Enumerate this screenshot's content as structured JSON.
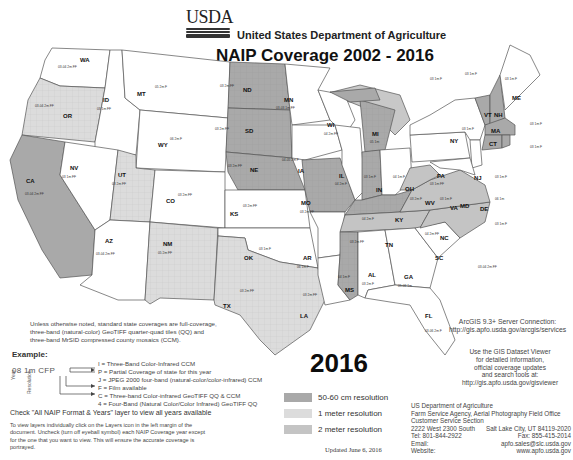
{
  "header": {
    "logo_text": "USDA",
    "department": "United States Department of Agriculture",
    "title": "NAIP Coverage 2002 - 2016"
  },
  "colors": {
    "res_50_60cm": "#a9a9a9",
    "res_1m": "#dcdcdc",
    "res_2m": "#c4c4c4",
    "no_coverage": "#ffffff",
    "water": "#c8c8c8",
    "border": "#555555"
  },
  "map": {
    "states": [
      {
        "abbr": "WA",
        "fill": "white",
        "notes": [
          "03-04 2m FF",
          "05 2m F",
          "06 1m F",
          "09-11-13-15 1m 4"
        ]
      },
      {
        "abbr": "OR",
        "fill": "1m",
        "notes": [
          "03-04 2m FF",
          "05 1m F",
          "09 2m FF",
          "09 1m F",
          "11-12-14-16 1m 4"
        ]
      },
      {
        "abbr": "ID",
        "fill": "white",
        "notes": [
          "03 1m FF",
          "04 1m",
          "06 2m FF",
          "09-11 1m 4",
          "13 50cm 4",
          "15 1m 4"
        ]
      },
      {
        "abbr": "MT",
        "fill": "white",
        "notes": [
          "05 2m F",
          "05 1m",
          "09 2m F",
          "09-11-13-15 1m 4"
        ]
      },
      {
        "abbr": "WY",
        "fill": "white",
        "notes": [
          "06 2m F",
          "06 1m",
          "09-12 1m 4",
          "15 50cm 4"
        ]
      },
      {
        "abbr": "CA",
        "fill": "50-60cm",
        "notes": [
          "03-04 2m FF",
          "05 1m",
          "06 2m F",
          "09-10 1m 4",
          "12-14 1m 4",
          "16 60cm 4"
        ]
      },
      {
        "abbr": "NV",
        "fill": "white",
        "notes": [
          "03 1m FF",
          "06 1m F",
          "10-13-15 1m 4"
        ]
      },
      {
        "abbr": "UT",
        "fill": "1m",
        "notes": [
          "03 2m FF",
          "04 1m FF",
          "06-09 1m",
          "11-14-16 1m 4"
        ]
      },
      {
        "abbr": "CO",
        "fill": "white",
        "notes": [
          "03 2m FF",
          "05 1m F",
          "05 2m FF",
          "09-11-13-15 1m 4"
        ]
      },
      {
        "abbr": "AZ",
        "fill": "white",
        "notes": [
          "03-04 2m FF",
          "07-10-13-15 1m 4"
        ]
      },
      {
        "abbr": "NM",
        "fill": "1m",
        "notes": [
          "05 2m FF",
          "09 1m",
          "11-14-16 1m 4"
        ]
      },
      {
        "abbr": "ND",
        "fill": "50-60cm",
        "notes": [
          "03 2m FF",
          "04 1m F",
          "05 1m F",
          "06 1m",
          "09-10 1m 4",
          "12-14-16 1m 4",
          "16 60cm 4"
        ]
      },
      {
        "abbr": "SD",
        "fill": "50-60cm",
        "notes": [
          "03 2m FF",
          "04 1m F",
          "05 1m F",
          "06 1m",
          "10-12-14 1m 4",
          "16 60cm 4"
        ]
      },
      {
        "abbr": "NE",
        "fill": "50-60cm",
        "notes": [
          "03 2m FF",
          "04 1m",
          "05-06 2m F",
          "06 1m",
          "07 2m FF",
          "09-10 1m 4",
          "12-14 1m 4",
          "16 60cm 4"
        ]
      },
      {
        "abbr": "KS",
        "fill": "white",
        "notes": [
          "03 2m FF",
          "03-05 2m F",
          "06 1m",
          "08 1m C",
          "10-12-14-15 1m 4"
        ]
      },
      {
        "abbr": "OK",
        "fill": "white",
        "notes": [
          "03 1m F",
          "04-06 1m F",
          "08 1m",
          "10-13-15 1m 4"
        ]
      },
      {
        "abbr": "TX",
        "fill": "1m",
        "notes": [
          "03 2m FF",
          "04 1m C",
          "05 1m",
          "06 2m FF",
          "08 1m 4P",
          "09 2m F",
          "10 1m 4",
          "12-14-16 1m 4"
        ]
      },
      {
        "abbr": "MN",
        "fill": "white",
        "notes": [
          "03-03 1m FF",
          "03 1m 2m FF",
          "05-06 2m FF",
          "08 1m 4J",
          "09 1m 4",
          "10-13-15 1m 4"
        ]
      },
      {
        "abbr": "IA",
        "fill": "white",
        "notes": [
          "04-05 2m F",
          "06 1m F",
          "07 2m F",
          "08-09 1m 4",
          "10-13 1m 4",
          "11-15 1m 4"
        ]
      },
      {
        "abbr": "MO",
        "fill": "50-60cm",
        "notes": [
          "03 2m FF",
          "03 1m F",
          "05-06 2m F",
          "07 1m F",
          "08-10-12-14 1m 4",
          "16 60cm 4"
        ]
      },
      {
        "abbr": "AR",
        "fill": "white",
        "notes": [
          "06 1m F",
          "09 1m",
          "10-13-15 1m 4"
        ]
      },
      {
        "abbr": "LA",
        "fill": "white",
        "notes": [
          "03 2m FF",
          "04 1m F",
          "05-06 1m F",
          "07 1m",
          "10-13-15 1m 4"
        ]
      },
      {
        "abbr": "WI",
        "fill": "white",
        "notes": [
          "04 2m FF",
          "05 1m F",
          "06 2m F",
          "08 1m",
          "10-13-15 1m 4"
        ]
      },
      {
        "abbr": "IL",
        "fill": "white",
        "notes": [
          "04 2m F",
          "05-06 2m F",
          "07-09 1m 4",
          "10-12 1m 4",
          "14 1m 4"
        ]
      },
      {
        "abbr": "MI",
        "fill": "50-60cm",
        "notes": [
          "05 1m",
          "09 1m F",
          "10 1m",
          "12-14 1m 4",
          "16 60cm 4"
        ]
      },
      {
        "abbr": "IN",
        "fill": "50-60cm",
        "notes": [
          "03 1m F",
          "05 2m FF",
          "06 1m",
          "08-10 1m",
          "12 1m 4",
          "14-16 1m 4"
        ]
      },
      {
        "abbr": "OH",
        "fill": "white",
        "notes": [
          "04 1m F",
          "05 2m F",
          "06 1m",
          "09-11 1m 4",
          "13-15 1m 4"
        ]
      },
      {
        "abbr": "KY",
        "fill": "50-60cm",
        "notes": [
          "04 2m F",
          "06 1m",
          "08-10 1m 4",
          "12-14 1m 4",
          "16 60cm 4"
        ]
      },
      {
        "abbr": "TN",
        "fill": "2m",
        "notes": [
          "03 2m FF",
          "05 1m",
          "06 1m J",
          "08-10-12-14 1m 4"
        ]
      },
      {
        "abbr": "MS",
        "fill": "50-60cm",
        "notes": [
          "04 1m F",
          "05 1m",
          "06 2m F",
          "07-09 1m",
          "10-12-14 1m 4",
          "16 60cm 4"
        ]
      },
      {
        "abbr": "AL",
        "fill": "white",
        "notes": [
          "03 2m F",
          "05 1m",
          "06-11-13-15 1m 4"
        ]
      },
      {
        "abbr": "GA",
        "fill": "white",
        "notes": [
          "05-06 1m",
          "07 1m",
          "09-10-13-15 1m 4"
        ]
      },
      {
        "abbr": "FL",
        "fill": "white",
        "notes": [
          "03-06 2m F",
          "07 1m",
          "10-13-15 1m 4"
        ]
      },
      {
        "abbr": "SC",
        "fill": "white",
        "notes": [
          "03-04 2m FF",
          "05 1m",
          "06 1m F",
          "09-11-13-15 1m 4"
        ]
      },
      {
        "abbr": "NC",
        "fill": "2m",
        "notes": [
          "04 2m FF",
          "05 1m F",
          "06 1m",
          "08-10 1m 4",
          "12-14-16 1m 4"
        ]
      },
      {
        "abbr": "VA",
        "fill": "2m",
        "notes": [
          "03 1m F",
          "04 1m FF",
          "06 2m F",
          "08 1m",
          "09-11 1m 4",
          "12-14-16 1m 4"
        ]
      },
      {
        "abbr": "WV",
        "fill": "2m",
        "notes": [
          "03 2m F",
          "05 1m",
          "07 1m",
          "09-11-14-16 1m 4"
        ]
      },
      {
        "abbr": "PA",
        "fill": "white",
        "notes": [
          "03 1m FF",
          "04 1m F",
          "05 2m F",
          "06 1m F",
          "08-10-13-15 1m 4"
        ]
      },
      {
        "abbr": "NY",
        "fill": "white",
        "notes": [
          "03 1m F",
          "04 1m FF",
          "06 1m",
          "09-11 1m 4",
          "13-15 1m 4"
        ]
      },
      {
        "abbr": "NJ",
        "fill": "white",
        "notes": [
          "03 1m F",
          "06 1m",
          "08 1m F",
          "10-13-15 1m 4"
        ]
      },
      {
        "abbr": "DE",
        "fill": "white",
        "notes": [
          "06 1m",
          "08-10-11-13-15 1m 4"
        ]
      },
      {
        "abbr": "MD",
        "fill": "white",
        "notes": [
          "03 1m F",
          "05 1m F",
          "07 1m",
          "09-11-13-15 1m 4"
        ]
      },
      {
        "abbr": "VT",
        "fill": "50-60cm",
        "notes": [
          "03 1m F",
          "04 2m F",
          "05 1m",
          "06 1m 2",
          "08 1m",
          "09 1m",
          "11-12 1m 4",
          "14 1m 4",
          "16 60cm 4"
        ]
      },
      {
        "abbr": "NH",
        "fill": "50-60cm",
        "notes": [
          "03 1m F",
          "04 2m F",
          "06 1m",
          "08-09 1m",
          "11-12 1m 4",
          "14 1m 4",
          "16 60cm 4"
        ]
      },
      {
        "abbr": "ME",
        "fill": "white",
        "notes": [
          "03 1m F",
          "07 1m F",
          "09 1m",
          "11-13-15 1m 4"
        ]
      },
      {
        "abbr": "MA",
        "fill": "50-60cm",
        "notes": [
          "03 1m F",
          "05 2m F",
          "08 1m",
          "09 1m",
          "10-12-14 1m 4",
          "16 60cm 4"
        ]
      },
      {
        "abbr": "CT",
        "fill": "50-60cm",
        "notes": [
          "03 1m F",
          "04-05 2m F",
          "06 1m",
          "08 1m 4",
          "10-12-14 1m 4",
          "16 60cm 4"
        ]
      },
      {
        "abbr": "RI",
        "fill": "50-60cm",
        "notes": [
          "03 1m F",
          "04-05 2m F",
          "06 1m",
          "08 1m 4",
          "10-12-14 1m 4",
          "16 60cm 4"
        ]
      }
    ]
  },
  "notes": {
    "standard": "Unless otherwise noted, standard state coverages are full-coverage, three-band (natural-color) GeoTIFF quarter-quad tiles (QQ) and three-band MrSID compressed county mosaics (CCM).",
    "example_title": "Example:",
    "example_code": "08 1m CFP",
    "example_axis_year": "Year",
    "example_axis_resolution": "Resolution",
    "example_lines": [
      "I = Three-Band Color-Infrared CCM",
      "P = Partial Coverage of state for this year",
      "J = JPEG 2000 four-band (natural-color/color-infrared) CCM",
      "F = Film available",
      "C = Three-band Color-infrared GeoTIFF QQ & CCM",
      "4 = Four-Band (Natural Color/Color Infrared) GeoTIFF QQ"
    ],
    "check": "Check \"All NAIP Format & Years\" layer to view all years available",
    "howto": "To view layers individually click on the Layers icon in the left margin of the document. Uncheck (turn off eyeball symbol) each NAIP Coverage year except for the one that you want to view. This will ensure the accurate coverage is portrayed."
  },
  "year_label": "2016",
  "legend": {
    "items": [
      {
        "label": "50-60 cm resolution",
        "color": "#a9a9a9"
      },
      {
        "label": "1 meter resolution",
        "color": "#dcdcdc"
      },
      {
        "label": "2 meter resolution",
        "color": "#c4c4c4"
      }
    ]
  },
  "updated": "Updated June 6, 2016",
  "arcgis": {
    "line1": "ArcGIS 9.3+ Server Connection:",
    "line2": "http://gis.apfo.usda.gov/arcgis/services"
  },
  "viewer": {
    "lines": [
      "Use the GIS Dataset Viewer",
      "for detailed information,",
      "official coverage updates",
      "and search tools at:",
      "http://gis.apfo.usda.gov/gisviewer"
    ]
  },
  "contact": {
    "org": "US Department of Agriculture",
    "agency": "Farm Service Agency, Aerial Photography Field Office",
    "section": "Customer Service Section",
    "address": "2222 West 2300 South",
    "city": "Salt Lake City, UT 84119-2020",
    "tel": "Tel: 801-844-2922",
    "fax": "Fax: 855-415-2014",
    "email_label": "Email:",
    "email": "apfo.sales@slc.usda.gov",
    "website_label": "Website:",
    "website": "www.apfo.usda.gov"
  }
}
